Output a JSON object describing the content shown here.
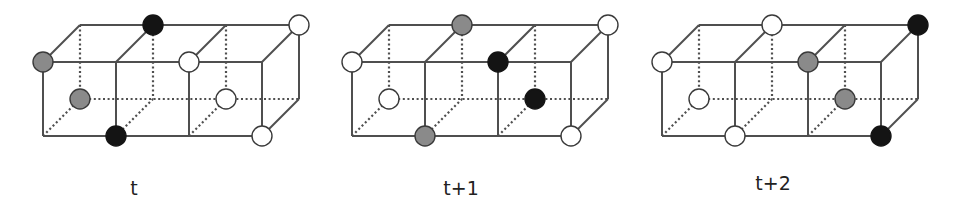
{
  "figure": {
    "colors": {
      "edge": "#4f4f4f",
      "black": "#141414",
      "gray": "#8a8a8a",
      "white": "#ffffff",
      "outline": "#3a3a3a"
    },
    "geometry": {
      "front_top_y": 62,
      "front_bottom_y": 136,
      "depth_dx": 37,
      "depth_dy": -37,
      "column_step": 73,
      "circle_radius": 10
    },
    "panels": [
      {
        "label": "t",
        "origin_x": 43,
        "label_x": 134,
        "label_y": 177,
        "particles": [
          {
            "face": "front",
            "row": "top",
            "col": 0,
            "color": "gray"
          },
          {
            "face": "back",
            "row": "top",
            "col": 1,
            "color": "black"
          },
          {
            "face": "front",
            "row": "top",
            "col": 2,
            "color": "white"
          },
          {
            "face": "back",
            "row": "top",
            "col": 3,
            "color": "white"
          },
          {
            "face": "back",
            "row": "bottom",
            "col": 0,
            "color": "gray"
          },
          {
            "face": "back",
            "row": "bottom",
            "col": 2,
            "color": "white"
          },
          {
            "face": "front",
            "row": "bottom",
            "col": 1,
            "color": "black"
          },
          {
            "face": "front",
            "row": "bottom",
            "col": 3,
            "color": "white"
          }
        ]
      },
      {
        "label": "t+1",
        "origin_x": 352,
        "label_x": 461,
        "label_y": 177,
        "particles": [
          {
            "face": "front",
            "row": "top",
            "col": 0,
            "color": "white"
          },
          {
            "face": "back",
            "row": "top",
            "col": 1,
            "color": "gray"
          },
          {
            "face": "front",
            "row": "top",
            "col": 2,
            "color": "black"
          },
          {
            "face": "back",
            "row": "top",
            "col": 3,
            "color": "white"
          },
          {
            "face": "back",
            "row": "bottom",
            "col": 0,
            "color": "white"
          },
          {
            "face": "back",
            "row": "bottom",
            "col": 2,
            "color": "black"
          },
          {
            "face": "front",
            "row": "bottom",
            "col": 1,
            "color": "gray"
          },
          {
            "face": "front",
            "row": "bottom",
            "col": 3,
            "color": "white"
          }
        ]
      },
      {
        "label": "t+2",
        "origin_x": 662,
        "label_x": 773,
        "label_y": 172,
        "particles": [
          {
            "face": "front",
            "row": "top",
            "col": 0,
            "color": "white"
          },
          {
            "face": "back",
            "row": "top",
            "col": 1,
            "color": "white"
          },
          {
            "face": "front",
            "row": "top",
            "col": 2,
            "color": "gray"
          },
          {
            "face": "back",
            "row": "top",
            "col": 3,
            "color": "black"
          },
          {
            "face": "back",
            "row": "bottom",
            "col": 0,
            "color": "white"
          },
          {
            "face": "back",
            "row": "bottom",
            "col": 2,
            "color": "gray"
          },
          {
            "face": "front",
            "row": "bottom",
            "col": 1,
            "color": "white"
          },
          {
            "face": "front",
            "row": "bottom",
            "col": 3,
            "color": "black"
          }
        ]
      }
    ]
  }
}
